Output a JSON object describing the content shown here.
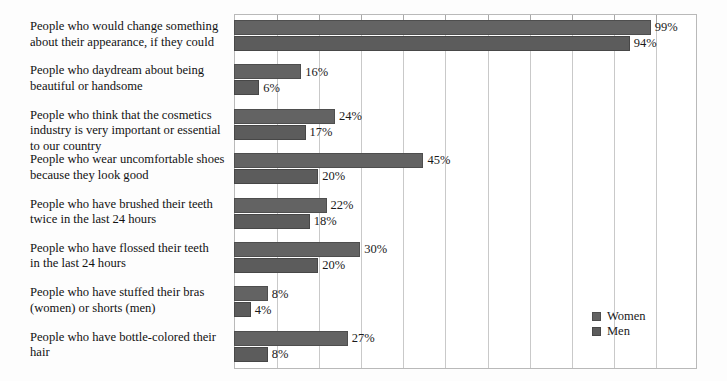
{
  "chart_data": {
    "type": "bar",
    "orientation": "horizontal",
    "title": "",
    "subtitle": "",
    "xlabel": "",
    "ylabel": "",
    "xlim": [
      0,
      110
    ],
    "xtick_values": [
      0,
      10,
      20,
      30,
      40,
      50,
      60,
      70,
      80,
      90,
      100,
      110
    ],
    "xtick_labels": [
      "",
      "",
      "",
      "",
      "",
      "",
      "",
      "",
      "",
      "",
      "",
      ""
    ],
    "grid": true,
    "legend_position": "lower-right",
    "value_suffix": "%",
    "categories": [
      "People who would change something about their appearance, if they could",
      "People who daydream about being beautiful or handsome",
      "People who think that the cosmetics industry is very important or essential to our country",
      "People who wear uncomfortable shoes because they look good",
      "People who have brushed their teeth twice in the last 24 hours",
      "People who have flossed their teeth in the last 24 hours",
      "People who have stuffed their bras (women) or shorts (men)",
      "People who have bottle-colored their hair"
    ],
    "category_lines": [
      [
        "People who would change something",
        "about their appearance, if they could"
      ],
      [
        "People who daydream about being",
        "beautiful or handsome"
      ],
      [
        "People who think that the cosmetics",
        "industry is very important or essential",
        "to our country"
      ],
      [
        "People who wear uncomfortable shoes",
        "because they look good"
      ],
      [
        "People who have brushed their teeth",
        "twice in the last 24 hours"
      ],
      [
        "People who have flossed their teeth",
        "in the last 24 hours"
      ],
      [
        "People who have stuffed their bras",
        "(women) or shorts (men)"
      ],
      [
        "People who have bottle-colored their",
        "hair"
      ]
    ],
    "series": [
      {
        "name": "Women",
        "color": "#636363",
        "values": [
          99,
          16,
          24,
          45,
          22,
          30,
          8,
          27
        ],
        "labels": [
          "99%",
          "16%",
          "24%",
          "45%",
          "22%",
          "30%",
          "8%",
          "27%"
        ]
      },
      {
        "name": "Men",
        "color": "#5c5c5c",
        "values": [
          94,
          6,
          17,
          20,
          18,
          20,
          4,
          8
        ],
        "labels": [
          "94%",
          "6%",
          "17%",
          "20%",
          "18%",
          "20%",
          "4%",
          "8%"
        ]
      }
    ]
  },
  "legend": {
    "items": [
      {
        "label": "Women",
        "color": "#636363"
      },
      {
        "label": "Men",
        "color": "#5c5c5c"
      }
    ]
  },
  "colors": {
    "women_bar": "#636363",
    "men_bar": "#5c5c5c",
    "gridline": "#c9c9c9",
    "frame": "#b9b9b9",
    "text": "#1a1a1a",
    "background": "#fdfdfd",
    "plot_background": "#ffffff"
  }
}
